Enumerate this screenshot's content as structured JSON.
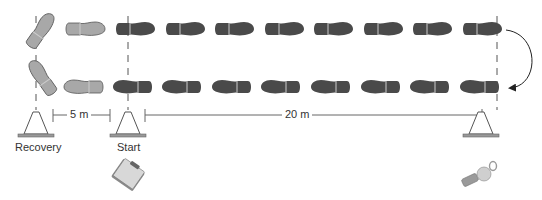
{
  "diagram": {
    "title": "",
    "labels": {
      "recovery": "Recovery",
      "start": "Start",
      "recovery_distance": "5 m",
      "sprint_distance": "20 m"
    },
    "colors": {
      "shoe_light": "#a8a8a8",
      "shoe_dark": "#4a4a4a",
      "outline": "#555555",
      "line": "#666666",
      "cone_stroke": "#555555",
      "cone_base": "#888888"
    },
    "markers": {
      "recovery_x": 36,
      "start_x": 128,
      "finish_x": 497
    },
    "footprints": {
      "top_row": [
        {
          "x": 40,
          "y": 27,
          "shade": "light",
          "direction": "diagonal-up-right"
        },
        {
          "x": 86,
          "y": 29,
          "shade": "light",
          "direction": "right"
        },
        {
          "x": 136,
          "y": 29,
          "shade": "dark",
          "direction": "right"
        },
        {
          "x": 185,
          "y": 29,
          "shade": "dark",
          "direction": "right"
        },
        {
          "x": 235,
          "y": 29,
          "shade": "dark",
          "direction": "right"
        },
        {
          "x": 284,
          "y": 29,
          "shade": "dark",
          "direction": "right"
        },
        {
          "x": 334,
          "y": 29,
          "shade": "dark",
          "direction": "right"
        },
        {
          "x": 384,
          "y": 29,
          "shade": "dark",
          "direction": "right"
        },
        {
          "x": 433,
          "y": 29,
          "shade": "dark",
          "direction": "right"
        },
        {
          "x": 483,
          "y": 29,
          "shade": "dark",
          "direction": "right"
        }
      ],
      "bottom_row": [
        {
          "x": 40,
          "y": 80,
          "shade": "light",
          "direction": "diagonal-down-left"
        },
        {
          "x": 84,
          "y": 87,
          "shade": "light",
          "direction": "left"
        },
        {
          "x": 132,
          "y": 87,
          "shade": "dark",
          "direction": "left"
        },
        {
          "x": 181,
          "y": 87,
          "shade": "dark",
          "direction": "left"
        },
        {
          "x": 231,
          "y": 87,
          "shade": "dark",
          "direction": "left"
        },
        {
          "x": 280,
          "y": 87,
          "shade": "dark",
          "direction": "left"
        },
        {
          "x": 330,
          "y": 87,
          "shade": "dark",
          "direction": "left"
        },
        {
          "x": 380,
          "y": 87,
          "shade": "dark",
          "direction": "left"
        },
        {
          "x": 429,
          "y": 87,
          "shade": "dark",
          "direction": "left"
        },
        {
          "x": 479,
          "y": 87,
          "shade": "dark",
          "direction": "left"
        }
      ]
    },
    "icons": {
      "cones": [
        "cone-icon",
        "cone-icon",
        "cone-icon"
      ],
      "clipboard": "clipboard-icon",
      "whistle": "whistle-icon",
      "turn_arrow": "curved-arrow-icon"
    }
  }
}
